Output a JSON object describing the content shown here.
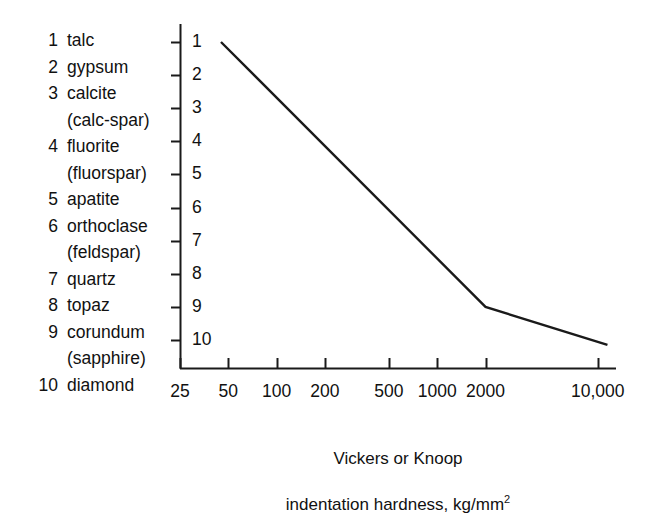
{
  "chart_data": {
    "type": "line",
    "title": "",
    "subtitle": "",
    "xlabel_line1": "Vickers or Knoop",
    "xlabel_line2": "indentation hardness, kg/mm",
    "xlabel_exponent": "2",
    "ylabel": "",
    "xscale": "log",
    "yscale": "linear",
    "xlim": [
      25,
      13000
    ],
    "ylim": [
      0.4,
      10.6
    ],
    "grid": false,
    "legend_position": "left-outside",
    "x_ticks": [
      {
        "value": 25,
        "label": "25"
      },
      {
        "value": 50,
        "label": "50"
      },
      {
        "value": 100,
        "label": "100"
      },
      {
        "value": 200,
        "label": "200"
      },
      {
        "value": 500,
        "label": "500"
      },
      {
        "value": 1000,
        "label": "1000"
      },
      {
        "value": 2000,
        "label": "2000"
      },
      {
        "value": 10000,
        "label": "10,000"
      }
    ],
    "y_ticks": [
      {
        "value": 1,
        "label": "1"
      },
      {
        "value": 2,
        "label": "2"
      },
      {
        "value": 3,
        "label": "3"
      },
      {
        "value": 4,
        "label": "4"
      },
      {
        "value": 5,
        "label": "5"
      },
      {
        "value": 6,
        "label": "6"
      },
      {
        "value": 7,
        "label": "7"
      },
      {
        "value": 8,
        "label": "8"
      },
      {
        "value": 9,
        "label": "9"
      },
      {
        "value": 10,
        "label": "10"
      }
    ],
    "series": [
      {
        "name": "Mohs vs indentation hardness",
        "color": "#1a1a1a",
        "points": [
          {
            "x": 45,
            "y": 1
          },
          {
            "x": 2000,
            "y": 9
          },
          {
            "x": 11500,
            "y": 10.15
          }
        ]
      }
    ]
  },
  "legend": {
    "items": [
      {
        "rank": "1",
        "name": "talc",
        "alt": ""
      },
      {
        "rank": "2",
        "name": "gypsum",
        "alt": ""
      },
      {
        "rank": "3",
        "name": "calcite",
        "alt": "(calc-spar)"
      },
      {
        "rank": "4",
        "name": "fluorite",
        "alt": "(fluorspar)"
      },
      {
        "rank": "5",
        "name": "apatite",
        "alt": ""
      },
      {
        "rank": "6",
        "name": "orthoclase",
        "alt": "(feldspar)"
      },
      {
        "rank": "7",
        "name": "quartz",
        "alt": ""
      },
      {
        "rank": "8",
        "name": "topaz",
        "alt": ""
      },
      {
        "rank": "9",
        "name": "corundum",
        "alt": "(sapphire)"
      },
      {
        "rank": "10",
        "name": "diamond",
        "alt": ""
      }
    ]
  },
  "colors": {
    "background": "#ffffff",
    "ink": "#1a1a1a",
    "axis": "#1a1a1a"
  }
}
